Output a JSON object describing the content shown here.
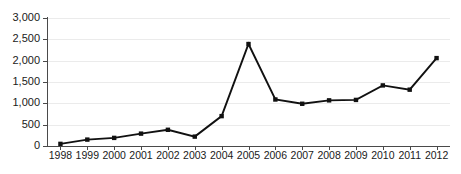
{
  "chart_data": {
    "type": "line",
    "title": "",
    "subtitle": "",
    "xlabel": "",
    "ylabel": "",
    "categories": [
      "1998",
      "1999",
      "2000",
      "2001",
      "2002",
      "2003",
      "2004",
      "2005",
      "2006",
      "2007",
      "2008",
      "2009",
      "2010",
      "2011",
      "2012"
    ],
    "values": [
      50,
      150,
      190,
      290,
      380,
      220,
      700,
      2390,
      1090,
      990,
      1070,
      1080,
      1420,
      1320,
      2060
    ],
    "series": [
      {
        "name": "series-1",
        "values": [
          50,
          150,
          190,
          290,
          380,
          220,
          700,
          2390,
          1090,
          990,
          1070,
          1080,
          1420,
          1320,
          2060
        ]
      }
    ],
    "ylim": [
      0,
      3000
    ],
    "ytick_values": [
      0,
      500,
      1000,
      1500,
      2000,
      2500,
      3000
    ],
    "ytick_labels": [
      "0",
      "500",
      "1,000",
      "1,500",
      "2,000",
      "2,500",
      "3,000"
    ],
    "xtick_labels": [
      "1998",
      "1999",
      "2000",
      "2001",
      "2002",
      "2003",
      "2004",
      "2005",
      "2006",
      "2007",
      "2008",
      "2009",
      "2010",
      "2011",
      "2012"
    ],
    "grid": true,
    "grid_axis": "y",
    "legend": false,
    "legend_position": "none",
    "marker": "square",
    "line_color": "#111111",
    "marker_color": "#111111",
    "grid_color": "#ebebeb",
    "axis_color": "#4a4a4a",
    "background_color": "#ffffff",
    "text_color": "#1a1a1a",
    "annotations": []
  },
  "layout": {
    "plot_left": 47,
    "plot_right": 450,
    "plot_top": 18,
    "plot_bottom": 146,
    "xtick_label_y": 151
  }
}
